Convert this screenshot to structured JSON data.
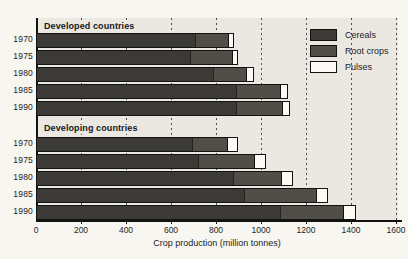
{
  "figure": {
    "background": "#f7f6f1",
    "plot_background": "#eae8e1"
  },
  "chart_data": {
    "type": "bar",
    "orientation": "horizontal",
    "stacked": true,
    "xlabel": "Crop production (million tonnes)",
    "xlim": [
      0,
      1600
    ],
    "x_ticks": [
      0,
      200,
      400,
      600,
      800,
      1000,
      1200,
      1400,
      1600
    ],
    "gridlines": {
      "values": [
        200,
        400,
        600,
        800,
        1000,
        1200,
        1400,
        1600
      ],
      "style": "dashed"
    },
    "series_names": [
      "Cereals",
      "Root crops",
      "Pulses"
    ],
    "legend": {
      "position": "top-right",
      "entries": [
        {
          "label": "Cereals",
          "color": "#3b3a37"
        },
        {
          "label": "Root crops",
          "color": "#514e48"
        },
        {
          "label": "Pulses",
          "color": "#fbfaf6"
        }
      ]
    },
    "groups": [
      {
        "label": "Developed countries",
        "rows": [
          {
            "year": "1970",
            "cereals": 700,
            "root_crops": 150,
            "pulses": 20
          },
          {
            "year": "1975",
            "cereals": 680,
            "root_crops": 185,
            "pulses": 25
          },
          {
            "year": "1980",
            "cereals": 780,
            "root_crops": 150,
            "pulses": 30
          },
          {
            "year": "1985",
            "cereals": 885,
            "root_crops": 195,
            "pulses": 30
          },
          {
            "year": "1990",
            "cereals": 885,
            "root_crops": 205,
            "pulses": 30
          }
        ]
      },
      {
        "label": "Developing countries",
        "rows": [
          {
            "year": "1970",
            "cereals": 690,
            "root_crops": 155,
            "pulses": 45
          },
          {
            "year": "1975",
            "cereals": 715,
            "root_crops": 250,
            "pulses": 50
          },
          {
            "year": "1980",
            "cereals": 870,
            "root_crops": 215,
            "pulses": 50
          },
          {
            "year": "1985",
            "cereals": 920,
            "root_crops": 320,
            "pulses": 50
          },
          {
            "year": "1990",
            "cereals": 1080,
            "root_crops": 280,
            "pulses": 55
          }
        ]
      }
    ]
  }
}
